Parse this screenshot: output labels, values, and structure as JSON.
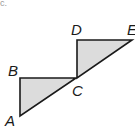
{
  "figure": {
    "fill_color": "#dcdcdc",
    "stroke_color": "#1a1a1a",
    "corner_label": "c.",
    "triangles": [
      {
        "name": "ABC",
        "points": "20,78 76,78 20,116"
      },
      {
        "name": "DCE",
        "points": "77,40 132,40 77,78"
      }
    ],
    "labels": {
      "A": "A",
      "B": "B",
      "C": "C",
      "D": "D",
      "E": "E"
    }
  }
}
